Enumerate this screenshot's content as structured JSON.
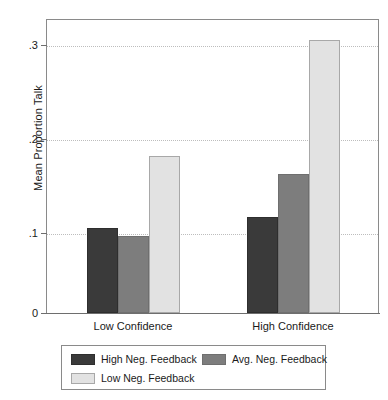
{
  "chart_data": {
    "type": "bar",
    "title": "",
    "subtitle": "",
    "xlabel": "",
    "ylabel": "Mean Proportion Talk",
    "categories": [
      "Low Confidence",
      "High Confidence"
    ],
    "series": [
      {
        "name": "High Neg. Feedback",
        "color": "#3a3a3a",
        "values": [
          0.1,
          0.113
        ]
      },
      {
        "name": "Avg. Neg. Feedback",
        "color": "#7d7d7d",
        "values": [
          0.091,
          0.164
        ]
      },
      {
        "name": "Low Neg. Feedback",
        "color": "#e2e2e2",
        "values": [
          0.185,
          0.322
        ]
      }
    ],
    "ylim": [
      0,
      0.345
    ],
    "yticks": [
      0,
      0.1,
      0.2,
      0.3
    ],
    "ytick_labels": [
      "0",
      ".1",
      ".2",
      ".3"
    ],
    "grid": true,
    "grid_style": "dotted",
    "grid_color": "#bdbdbd",
    "legend_position": "bottom",
    "frame": true,
    "frame_color": "#8a8a8a",
    "background": "#ffffff"
  },
  "axes": {
    "y_title": "Mean Proportion Talk",
    "y_tick_labels": [
      "0",
      ".1",
      ".2",
      ".3"
    ],
    "x_tick_labels": [
      "Low Confidence",
      "High Confidence"
    ]
  },
  "legend": {
    "entries": [
      {
        "label": "High Neg. Feedback",
        "swatch": "dark"
      },
      {
        "label": "Avg. Neg. Feedback",
        "swatch": "medium"
      },
      {
        "label": "Low Neg. Feedback",
        "swatch": "light"
      }
    ]
  }
}
